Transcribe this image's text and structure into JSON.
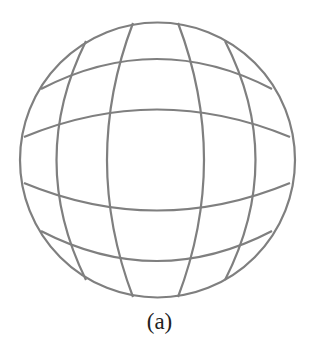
{
  "figure": {
    "caption": "(a)",
    "stroke_color": "#7f7f7f",
    "stroke_width": 2.2,
    "circle": {
      "cx": 157.5,
      "cy": 160,
      "r": 137.5
    },
    "horizontal_lines": [
      "M41,89 Q157,29 272,89",
      "M24,137 Q157,82 290,137",
      "M24,183 Q157,238 290,183",
      "M41,231 Q157,291 272,231"
    ],
    "vertical_lines": [
      "M86,41 Q27,160 86,280",
      "M133,23 Q81,160 133,297",
      "M178,23 Q230,160 178,297",
      "M225,41 Q286,160 225,280"
    ]
  }
}
